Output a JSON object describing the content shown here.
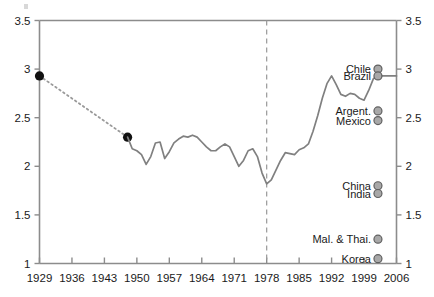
{
  "chart_data": {
    "type": "line",
    "title": "",
    "subtitle": "",
    "xlabel": "",
    "ylabel": "",
    "xlim": [
      1929,
      2006
    ],
    "ylim": [
      1,
      3.5
    ],
    "grid": false,
    "legend_position": "none",
    "x_ticks": [
      1929,
      1936,
      1943,
      1950,
      1957,
      1964,
      1971,
      1978,
      1985,
      1992,
      1999,
      2006
    ],
    "y_ticks": [
      1,
      1.5,
      2,
      2.5,
      3,
      3.5
    ],
    "y_tick_labels_left": [
      "1",
      "1.5",
      "2",
      "2.5",
      "3",
      "3.5"
    ],
    "y_tick_labels_right": [
      "1",
      "1.5",
      "2",
      "2.5",
      "3",
      "3.5"
    ],
    "x_tick_labels": [
      "1929",
      "1936",
      "1943",
      "1950",
      "1957",
      "1964",
      "1971",
      "1978",
      "1985",
      "1992",
      "1999",
      "2006"
    ],
    "annotations": [
      {
        "name": "reference-line-1978",
        "type": "vline",
        "x": 1978,
        "style": "dashed",
        "color": "#999999"
      }
    ],
    "series": [
      {
        "name": "early-dotted-segment",
        "style": "dotted",
        "color": "#9a9a9a",
        "markers": "filled-circle-black",
        "points": [
          {
            "x": 1929,
            "y": 2.93
          },
          {
            "x": 1948,
            "y": 2.3
          }
        ]
      },
      {
        "name": "main-series",
        "style": "solid",
        "color": "#808080",
        "markers": "none",
        "points": [
          {
            "x": 1948,
            "y": 2.3
          },
          {
            "x": 1949,
            "y": 2.18
          },
          {
            "x": 1950,
            "y": 2.16
          },
          {
            "x": 1951,
            "y": 2.12
          },
          {
            "x": 1952,
            "y": 2.02
          },
          {
            "x": 1953,
            "y": 2.1
          },
          {
            "x": 1954,
            "y": 2.24
          },
          {
            "x": 1955,
            "y": 2.25
          },
          {
            "x": 1956,
            "y": 2.08
          },
          {
            "x": 1957,
            "y": 2.15
          },
          {
            "x": 1958,
            "y": 2.24
          },
          {
            "x": 1959,
            "y": 2.28
          },
          {
            "x": 1960,
            "y": 2.31
          },
          {
            "x": 1961,
            "y": 2.3
          },
          {
            "x": 1962,
            "y": 2.32
          },
          {
            "x": 1963,
            "y": 2.3
          },
          {
            "x": 1964,
            "y": 2.25
          },
          {
            "x": 1965,
            "y": 2.2
          },
          {
            "x": 1966,
            "y": 2.16
          },
          {
            "x": 1967,
            "y": 2.16
          },
          {
            "x": 1968,
            "y": 2.2
          },
          {
            "x": 1969,
            "y": 2.23
          },
          {
            "x": 1970,
            "y": 2.2
          },
          {
            "x": 1971,
            "y": 2.1
          },
          {
            "x": 1972,
            "y": 2.0
          },
          {
            "x": 1973,
            "y": 2.06
          },
          {
            "x": 1974,
            "y": 2.16
          },
          {
            "x": 1975,
            "y": 2.18
          },
          {
            "x": 1976,
            "y": 2.1
          },
          {
            "x": 1977,
            "y": 1.93
          },
          {
            "x": 1978,
            "y": 1.82
          },
          {
            "x": 1979,
            "y": 1.86
          },
          {
            "x": 1980,
            "y": 1.96
          },
          {
            "x": 1981,
            "y": 2.06
          },
          {
            "x": 1982,
            "y": 2.14
          },
          {
            "x": 1983,
            "y": 2.13
          },
          {
            "x": 1984,
            "y": 2.12
          },
          {
            "x": 1985,
            "y": 2.17
          },
          {
            "x": 1986,
            "y": 2.19
          },
          {
            "x": 1987,
            "y": 2.23
          },
          {
            "x": 1988,
            "y": 2.36
          },
          {
            "x": 1989,
            "y": 2.52
          },
          {
            "x": 1990,
            "y": 2.7
          },
          {
            "x": 1991,
            "y": 2.85
          },
          {
            "x": 1992,
            "y": 2.93
          },
          {
            "x": 1993,
            "y": 2.84
          },
          {
            "x": 1994,
            "y": 2.74
          },
          {
            "x": 1995,
            "y": 2.72
          },
          {
            "x": 1996,
            "y": 2.75
          },
          {
            "x": 1997,
            "y": 2.74
          },
          {
            "x": 1998,
            "y": 2.7
          },
          {
            "x": 1999,
            "y": 2.68
          },
          {
            "x": 2000,
            "y": 2.78
          },
          {
            "x": 2001,
            "y": 2.9
          },
          {
            "x": 2002,
            "y": 2.93
          },
          {
            "x": 2004,
            "y": 2.93
          },
          {
            "x": 2006,
            "y": 2.93
          }
        ]
      }
    ],
    "country_markers": [
      {
        "label": "Chile",
        "y": 3.0,
        "x": 2002,
        "color": "#9e9e9e"
      },
      {
        "label": "Brazil",
        "y": 2.93,
        "x": 2002,
        "color": "#9e9e9e"
      },
      {
        "label": "Argent.",
        "y": 2.57,
        "x": 2002,
        "color": "#9e9e9e"
      },
      {
        "label": "Mexico",
        "y": 2.47,
        "x": 2002,
        "color": "#9e9e9e"
      },
      {
        "label": "China",
        "y": 1.8,
        "x": 2002,
        "color": "#9e9e9e"
      },
      {
        "label": "India",
        "y": 1.72,
        "x": 2002,
        "color": "#9e9e9e"
      },
      {
        "label": "Mal. & Thai.",
        "y": 1.25,
        "x": 2002,
        "color": "#9e9e9e"
      },
      {
        "label": "Korea",
        "y": 1.05,
        "x": 2002,
        "color": "#9e9e9e"
      }
    ],
    "colors": {
      "axis": "#8c8c8c",
      "line": "#808080",
      "dotted": "#a0a0a0",
      "marker_black": "#111111",
      "marker_gray_fill": "#a8a8a8",
      "marker_gray_stroke": "#606060",
      "reference_line": "#9e9e9e",
      "text": "#1a1a1a",
      "background": "#ffffff"
    }
  }
}
